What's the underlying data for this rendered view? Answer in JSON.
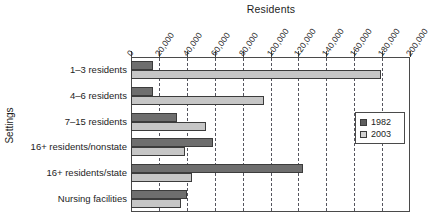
{
  "chart_data": {
    "type": "bar",
    "orientation": "horizontal",
    "title": "Residents",
    "xlabel": "Residents",
    "ylabel": "Settings",
    "categories": [
      "1–3 residents",
      "4–6 residents",
      "7–15 residents",
      "16+ residents/nonstate",
      "16+ residents/state",
      "Nursing facilities"
    ],
    "series": [
      {
        "name": "1982",
        "color": "#6e6e6e",
        "values": [
          16000,
          16000,
          33000,
          59000,
          123000,
          40000
        ]
      },
      {
        "name": "2003",
        "color": "#c6c6c6",
        "values": [
          179000,
          95000,
          54000,
          39000,
          44000,
          36000
        ]
      }
    ],
    "xlim": [
      0,
      200000
    ],
    "xticks": [
      0,
      20000,
      40000,
      60000,
      80000,
      100000,
      120000,
      140000,
      160000,
      180000,
      200000
    ],
    "xtick_labels": [
      "0",
      "20,000",
      "40,000",
      "60,000",
      "80,000",
      "100,000",
      "120,000",
      "140,000",
      "160,000",
      "180,000",
      "200,000"
    ],
    "grid": true,
    "grid_style": "dashed",
    "legend_position": "right-middle",
    "legend_entries": [
      "1982",
      "2003"
    ]
  }
}
